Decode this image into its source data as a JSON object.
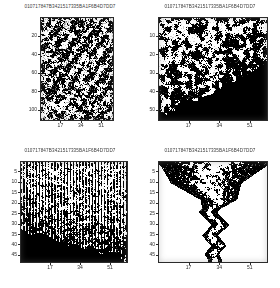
{
  "document": {
    "kind": "scanned-figure-grid",
    "layout": "2x2",
    "background_color": "#ffffff",
    "ink_color": "#000000",
    "axis_color": "#2b2b2b"
  },
  "shared": {
    "title": "010717847B3421517335BA1F6B4D7DD7",
    "xticks": [
      "17",
      "34",
      "51"
    ]
  },
  "panels": [
    {
      "id": "top-left",
      "title": "010717847B3421517335BA1F6B4D7DD7",
      "yticks": [
        "20",
        "40",
        "60",
        "80",
        "100"
      ],
      "xticks": [
        "17",
        "34",
        "51"
      ]
    },
    {
      "id": "top-right",
      "title": "010717847B3421517335BA1F6B4D7DD7",
      "yticks": [
        "10",
        "20",
        "30",
        "40",
        "50"
      ],
      "xticks": [
        "17",
        "34",
        "51"
      ]
    },
    {
      "id": "bottom-left",
      "title": "010717847B3421517335BA1F6B4D7DD7",
      "yticks": [
        "5",
        "10",
        "15",
        "20",
        "25",
        "30",
        "35",
        "40",
        "45"
      ],
      "xticks": [
        "17",
        "34",
        "51"
      ]
    },
    {
      "id": "bottom-right",
      "title": "010717847B3421517335BA1F6B4D7DD7",
      "yticks": [
        "5",
        "10",
        "15",
        "20",
        "25",
        "30",
        "35",
        "40",
        "45"
      ],
      "xticks": [
        "17",
        "34",
        "51"
      ]
    }
  ],
  "chart_data": [
    {
      "type": "heatmap",
      "id": "top-left",
      "title": "010717847B3421517335BA1F6B4D7DD7",
      "xlabel": "",
      "ylabel": "",
      "xlim": [
        0,
        60
      ],
      "ylim": [
        110,
        0
      ],
      "xticks": [
        17,
        34,
        51
      ],
      "yticks": [
        20,
        40,
        60,
        80,
        100
      ],
      "grid": false,
      "legend": false,
      "colormap": "binary",
      "description": "Dense dithered binary noise filling the full axes, mid-gray average density with faint diagonal streak structure running lower-left to upper-right.",
      "fill_density": 0.52,
      "pattern": "isotropic-dither-with-diagonal-streaks",
      "nx": 60,
      "ny": 110
    },
    {
      "type": "heatmap",
      "id": "top-right",
      "title": "010717847B3421517335BA1F6B4D7DD7",
      "xlabel": "",
      "ylabel": "",
      "xlim": [
        0,
        60
      ],
      "ylim": [
        55,
        0
      ],
      "xticks": [
        17,
        34,
        51
      ],
      "yticks": [
        10,
        20,
        30,
        40,
        50
      ],
      "grid": false,
      "legend": false,
      "colormap": "binary",
      "description": "High-contrast blocky black and white noise in the upper-left region, bounded by a diagonal edge; the lower-right triangle is solid black.",
      "fill_density": 0.55,
      "pattern": "coarse-noise-above-diagonal-solid-black-below",
      "boundary": {
        "from": [
          0,
          52
        ],
        "to": [
          60,
          26
        ]
      },
      "nx": 60,
      "ny": 55
    },
    {
      "type": "heatmap",
      "id": "bottom-left",
      "title": "010717847B3421517335BA1F6B4D7DD7",
      "xlabel": "",
      "ylabel": "",
      "xlim": [
        0,
        60
      ],
      "ylim": [
        48,
        0
      ],
      "xticks": [
        17,
        34,
        51
      ],
      "yticks": [
        5,
        10,
        15,
        20,
        25,
        30,
        35,
        40,
        45
      ],
      "grid": false,
      "legend": false,
      "colormap": "binary",
      "description": "Binary noise with strong vertical striping across the upper two thirds; a solid black wedge occupies the bottom, rising highest at the left edge.",
      "fill_density": 0.5,
      "pattern": "vertically-striped-noise-with-black-basal-wedge",
      "boundary": {
        "from": [
          0,
          33
        ],
        "to": [
          60,
          46
        ]
      },
      "nx": 60,
      "ny": 48
    },
    {
      "type": "scatter",
      "id": "bottom-right",
      "title": "010717847B3421517335BA1F6B4D7DD7",
      "xlabel": "",
      "ylabel": "",
      "xlim": [
        0,
        60
      ],
      "ylim": [
        48,
        0
      ],
      "xticks": [
        17,
        34,
        51
      ],
      "yticks": [
        5,
        10,
        15,
        20,
        25,
        30,
        35,
        40,
        45
      ],
      "grid": false,
      "legend": false,
      "colormap": "binary",
      "description": "White field with black speckle forming a wide funnel at the top that narrows downward into a thin zigzag band oscillating about x = 30.",
      "fill_density": 0.17,
      "pattern": "funnel-narrowing-to-zigzag",
      "zigzag_x": [
        30,
        26,
        33,
        27,
        34,
        28,
        33,
        29,
        31
      ],
      "zigzag_y": [
        2,
        10,
        18,
        24,
        30,
        35,
        40,
        44,
        47
      ],
      "funnel": {
        "top_left_x": 2,
        "top_right_x": 58,
        "apex_y": 22
      },
      "nx": 60,
      "ny": 48
    }
  ]
}
